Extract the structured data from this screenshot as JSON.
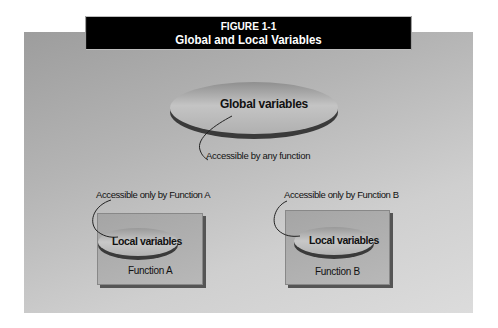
{
  "figure": {
    "label": "FIGURE 1-1",
    "title": "Global and Local Variables"
  },
  "global": {
    "label": "Global  variables",
    "annotation": "Accessible by any function"
  },
  "functions": [
    {
      "name": "Function A",
      "local_label": "Local variables",
      "annotation": "Accessible only by Function A"
    },
    {
      "name": "Function B",
      "local_label": "Local variables",
      "annotation": "Accessible only by Function B"
    }
  ],
  "colors": {
    "title_bg": "#000000",
    "title_fg": "#ffffff",
    "panel_gray": "#b4b4b4",
    "ellipse_edge": "#3a3a3a"
  }
}
